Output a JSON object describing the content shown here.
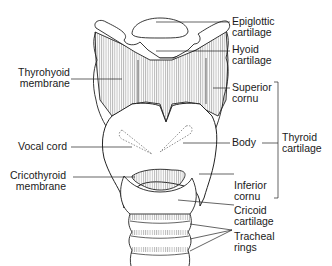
{
  "diagram": {
    "colors": {
      "line": "#222222",
      "background": "#ffffff",
      "hatch": "#555555"
    },
    "labels_left": [
      {
        "id": "thyrohyoid-membrane",
        "line1": "Thyrohyoid",
        "line2": "membrane"
      },
      {
        "id": "vocal-cord",
        "line1": "Vocal cord",
        "line2": ""
      },
      {
        "id": "cricothyroid-membrane",
        "line1": "Cricothyroid",
        "line2": "membrane"
      }
    ],
    "labels_right": [
      {
        "id": "epiglottic-cartilage",
        "line1": "Epiglottic",
        "line2": "cartilage"
      },
      {
        "id": "hyoid-cartilage",
        "line1": "Hyoid",
        "line2": "cartilage"
      },
      {
        "id": "superior-cornu",
        "line1": "Superior",
        "line2": "cornu"
      },
      {
        "id": "body",
        "line1": "Body",
        "line2": ""
      },
      {
        "id": "inferior-cornu",
        "line1": "Inferior",
        "line2": "cornu"
      },
      {
        "id": "cricoid-cartilage",
        "line1": "Cricoid",
        "line2": "cartilage"
      },
      {
        "id": "tracheal-rings",
        "line1": "Tracheal",
        "line2": "rings"
      }
    ],
    "bracket_label": {
      "id": "thyroid-cartilage",
      "line1": "Thyroid",
      "line2": "cartilage"
    }
  }
}
